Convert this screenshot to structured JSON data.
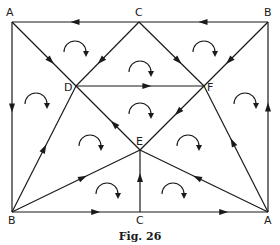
{
  "figure": {
    "caption": "Fig. 26",
    "vertices": [
      {
        "id": "A_tl",
        "label": "A",
        "x": 12,
        "y": 22,
        "lx": 6,
        "ly": 16
      },
      {
        "id": "C_t",
        "label": "C",
        "x": 139,
        "y": 22,
        "lx": 135,
        "ly": 16
      },
      {
        "id": "B_tr",
        "label": "B",
        "x": 268,
        "y": 22,
        "lx": 264,
        "ly": 16
      },
      {
        "id": "D",
        "label": "D",
        "x": 76,
        "y": 86,
        "lx": 64,
        "ly": 91
      },
      {
        "id": "F",
        "label": "F",
        "x": 204,
        "y": 86,
        "lx": 207,
        "ly": 91
      },
      {
        "id": "E",
        "label": "E",
        "x": 140,
        "y": 150,
        "lx": 136,
        "ly": 145
      },
      {
        "id": "B_bl",
        "label": "B",
        "x": 12,
        "y": 212,
        "lx": 8,
        "ly": 224
      },
      {
        "id": "C_b",
        "label": "C",
        "x": 140,
        "y": 212,
        "lx": 136,
        "ly": 224
      },
      {
        "id": "A_br",
        "label": "A",
        "x": 268,
        "y": 212,
        "lx": 264,
        "ly": 224
      }
    ],
    "edges": [
      {
        "from": "B_tr",
        "to": "C_t",
        "arrow_at": 0.5
      },
      {
        "from": "C_t",
        "to": "A_tl",
        "arrow_at": 0.5
      },
      {
        "from": "A_tl",
        "to": "B_bl",
        "arrow_at": 0.45
      },
      {
        "from": "A_br",
        "to": "B_tr",
        "arrow_at": 0.55
      },
      {
        "from": "B_bl",
        "to": "C_b",
        "arrow_at": 0.65
      },
      {
        "from": "C_b",
        "to": "A_br",
        "arrow_at": 0.65
      },
      {
        "from": "A_tl",
        "to": "D",
        "arrow_at": 0.6
      },
      {
        "from": "C_t",
        "to": "D",
        "arrow_at": 0.6
      },
      {
        "from": "C_t",
        "to": "F",
        "arrow_at": 0.6
      },
      {
        "from": "B_tr",
        "to": "F",
        "arrow_at": 0.6
      },
      {
        "from": "D",
        "to": "F",
        "arrow_at": 0.55
      },
      {
        "from": "E",
        "to": "D",
        "arrow_at": 0.4
      },
      {
        "from": "F",
        "to": "E",
        "arrow_at": 0.4
      },
      {
        "from": "B_bl",
        "to": "D",
        "arrow_at": 0.5
      },
      {
        "from": "B_bl",
        "to": "E",
        "arrow_at": 0.55
      },
      {
        "from": "C_b",
        "to": "E",
        "arrow_at": 0.55
      },
      {
        "from": "A_br",
        "to": "E",
        "arrow_at": 0.55
      },
      {
        "from": "A_br",
        "to": "F",
        "arrow_at": 0.55
      }
    ],
    "circulations": [
      {
        "face": "A-C-D",
        "cx": 75,
        "cy": 48,
        "direction": "clockwise"
      },
      {
        "face": "C-B-F",
        "cx": 204,
        "cy": 48,
        "direction": "clockwise"
      },
      {
        "face": "C-D-F",
        "cx": 140,
        "cy": 68,
        "direction": "clockwise"
      },
      {
        "face": "A-D-B",
        "cx": 36,
        "cy": 100,
        "direction": "clockwise"
      },
      {
        "face": "B-F-A",
        "cx": 245,
        "cy": 100,
        "direction": "clockwise"
      },
      {
        "face": "D-E-F",
        "cx": 140,
        "cy": 110,
        "direction": "clockwise"
      },
      {
        "face": "B-D-E",
        "cx": 90,
        "cy": 142,
        "direction": "clockwise"
      },
      {
        "face": "F-A-E",
        "cx": 188,
        "cy": 142,
        "direction": "clockwise"
      },
      {
        "face": "B-E-C",
        "cx": 107,
        "cy": 190,
        "direction": "clockwise"
      },
      {
        "face": "C-E-A",
        "cx": 173,
        "cy": 190,
        "direction": "clockwise"
      }
    ]
  }
}
